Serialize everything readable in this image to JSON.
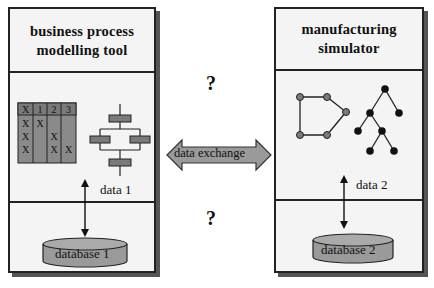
{
  "left_tool": {
    "title_line1": "business process",
    "title_line2": "modelling tool",
    "matrix": {
      "header": [
        "X",
        "1",
        "2",
        "3"
      ],
      "rows": [
        [
          "X",
          "X",
          "",
          ""
        ],
        [
          "X",
          "",
          "X",
          ""
        ],
        [
          "X",
          "",
          "X",
          "X"
        ]
      ]
    },
    "data_label": "data 1",
    "database_label": "database 1"
  },
  "right_tool": {
    "title_line1": "manufacturing",
    "title_line2": "simulator",
    "data_label": "data 2",
    "database_label": "database 2"
  },
  "center": {
    "exchange_label": "data exchange",
    "question_top": "?",
    "question_bottom": "?"
  },
  "colors": {
    "panel_bg": "#f4f4f4",
    "border": "#222222",
    "shadow": "#555555",
    "fill_gray": "#9a9a9a",
    "matrix_fill": "#8a8a8a",
    "node_dark": "#111111",
    "node_gray": "#7a7a7a"
  }
}
